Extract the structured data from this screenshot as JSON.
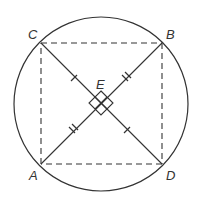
{
  "diagram": {
    "type": "geometry",
    "points": {
      "A": {
        "label": "A",
        "x": 41,
        "y": 164
      },
      "B": {
        "label": "B",
        "x": 162,
        "y": 43
      },
      "C": {
        "label": "C",
        "x": 41,
        "y": 43
      },
      "D": {
        "label": "D",
        "x": 162,
        "y": 164
      },
      "E": {
        "label": "E",
        "x": 101,
        "y": 103
      }
    },
    "circle": {
      "cx": 101,
      "cy": 104,
      "r": 87
    },
    "sides_dashed": [
      "CB",
      "BD",
      "DA",
      "AC"
    ],
    "diagonals_solid": [
      "AB",
      "CD"
    ],
    "tick_marks": {
      "CE": 1,
      "ED": 1,
      "AE": 2,
      "EB": 2
    },
    "right_angle_marks_at": "E",
    "colors": {
      "stroke": "#333333",
      "background": "#ffffff"
    }
  }
}
